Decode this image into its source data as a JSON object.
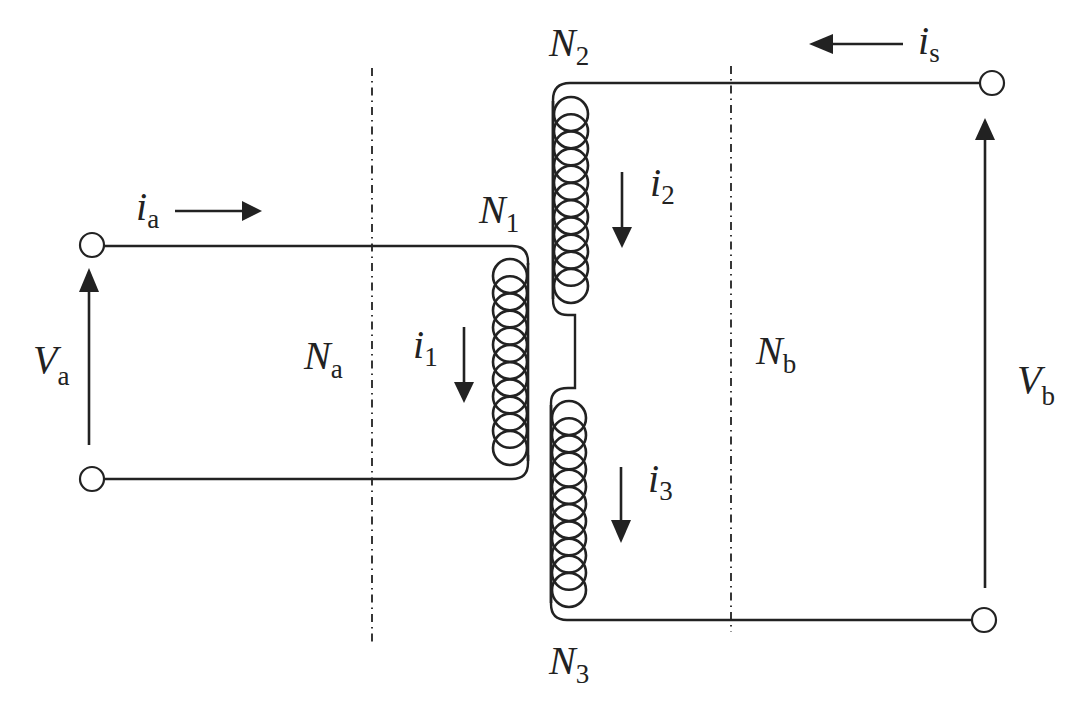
{
  "diagram": {
    "type": "transformer-circuit",
    "labels": {
      "ia": {
        "main": "i",
        "sub": "a"
      },
      "is": {
        "main": "i",
        "sub": "s"
      },
      "i1": {
        "main": "i",
        "sub": "1"
      },
      "i2": {
        "main": "i",
        "sub": "2"
      },
      "i3": {
        "main": "i",
        "sub": "3"
      },
      "Va": {
        "main": "V",
        "sub": "a"
      },
      "Vb": {
        "main": "V",
        "sub": "b"
      },
      "Na": {
        "main": "N",
        "sub": "a"
      },
      "Nb": {
        "main": "N",
        "sub": "b"
      },
      "N1": {
        "main": "N",
        "sub": "1"
      },
      "N2": {
        "main": "N",
        "sub": "2"
      },
      "N3": {
        "main": "N",
        "sub": "3"
      }
    },
    "windings": [
      {
        "name": "N1",
        "side": "primary",
        "current": "i1",
        "current_direction": "down"
      },
      {
        "name": "N2",
        "side": "secondary-upper",
        "current": "i2",
        "current_direction": "down"
      },
      {
        "name": "N3",
        "side": "secondary-lower",
        "current": "i3",
        "current_direction": "down"
      }
    ],
    "ports": [
      {
        "name": "a",
        "voltage": "Va",
        "current": "ia",
        "current_direction": "right",
        "voltage_direction": "up"
      },
      {
        "name": "b",
        "voltage": "Vb",
        "current": "is",
        "current_direction": "left",
        "voltage_direction": "up"
      }
    ],
    "boundaries": [
      {
        "label": "Na",
        "style": "dash-dot"
      },
      {
        "label": "Nb",
        "style": "dash-dot"
      }
    ]
  }
}
